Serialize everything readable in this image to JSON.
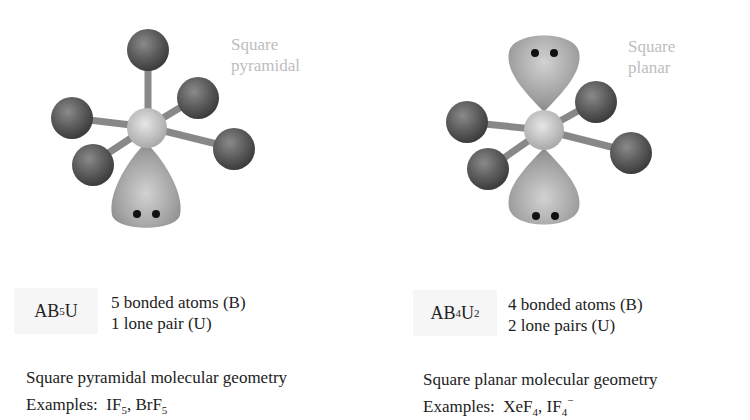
{
  "panels": [
    {
      "geometry_label_line1": "Square",
      "geometry_label_line2": "pyramidal",
      "formula": {
        "base": "AB",
        "sub1": "5",
        "mid": "U",
        "sub2": ""
      },
      "bonded_atoms": "5 bonded atoms (B)",
      "lone_pairs": "1 lone pair (U)",
      "geometry_title": "Square pyramidal molecular geometry",
      "examples_label": "Examples:",
      "examples": [
        {
          "base": "IF",
          "sub": "5",
          "sup": "",
          "sep": ", "
        },
        {
          "base": "BrF",
          "sub": "5",
          "sup": "",
          "sep": ""
        }
      ]
    },
    {
      "geometry_label_line1": "Square",
      "geometry_label_line2": "planar",
      "formula": {
        "base": "AB",
        "sub1": "4",
        "mid": "U",
        "sub2": "2"
      },
      "bonded_atoms": "4 bonded atoms (B)",
      "lone_pairs": "2 lone pairs (U)",
      "geometry_title": "Square planar molecular geometry",
      "examples_label": "Examples:",
      "examples": [
        {
          "base": "XeF",
          "sub": "4",
          "sup": "",
          "sep": ", "
        },
        {
          "base": "IF",
          "sub": "4",
          "sup": "−",
          "sep": ""
        }
      ]
    }
  ],
  "colors": {
    "outer_atom": "#5a5a5a",
    "central_atom": "#c8c8c8",
    "bond": "#8a8a8a",
    "lone_pair_lobe": "#a8a8a8",
    "electron_dot": "#111111",
    "geometry_label": "#bdbdbd"
  }
}
